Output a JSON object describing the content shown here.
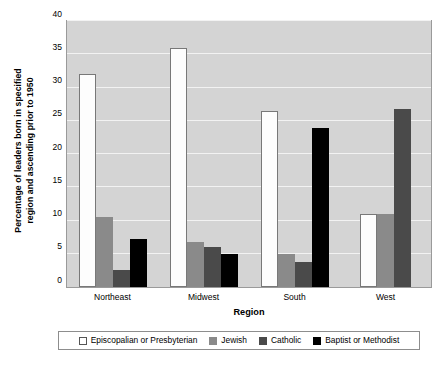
{
  "chart_data": {
    "type": "bar",
    "title": "",
    "xlabel": "Region",
    "ylabel": "Percentage of leaders born in specified region and ascending prior to 1950",
    "ylabel_line1": "Percentage of leaders born in specified",
    "ylabel_line2": "region and ascending prior to 1950",
    "categories": [
      "Northeast",
      "Midwest",
      "South",
      "West"
    ],
    "ylim": [
      0,
      40
    ],
    "yticks": [
      0,
      5,
      10,
      15,
      20,
      25,
      30,
      35,
      40
    ],
    "ytick_labels": [
      "0",
      "5",
      "10",
      "15",
      "20",
      "25",
      "30",
      "35",
      "40"
    ],
    "grid": true,
    "legend_position": "bottom",
    "plot_background": "#d4d4d4",
    "gridline_color": "#f2f2f2",
    "series": [
      {
        "name": "Episcopalian or Presbyterian",
        "color": "#ffffff",
        "values": [
          32.0,
          36.0,
          26.5,
          11.0
        ]
      },
      {
        "name": "Jewish",
        "color": "#8a8a8a",
        "values": [
          10.6,
          6.8,
          5.0,
          11.0
        ]
      },
      {
        "name": "Catholic",
        "color": "#4a4a4a",
        "values": [
          2.5,
          6.0,
          3.7,
          26.8
        ]
      },
      {
        "name": "Baptist or Methodist",
        "color": "#000000",
        "values": [
          7.2,
          4.9,
          23.9,
          0
        ]
      }
    ]
  }
}
